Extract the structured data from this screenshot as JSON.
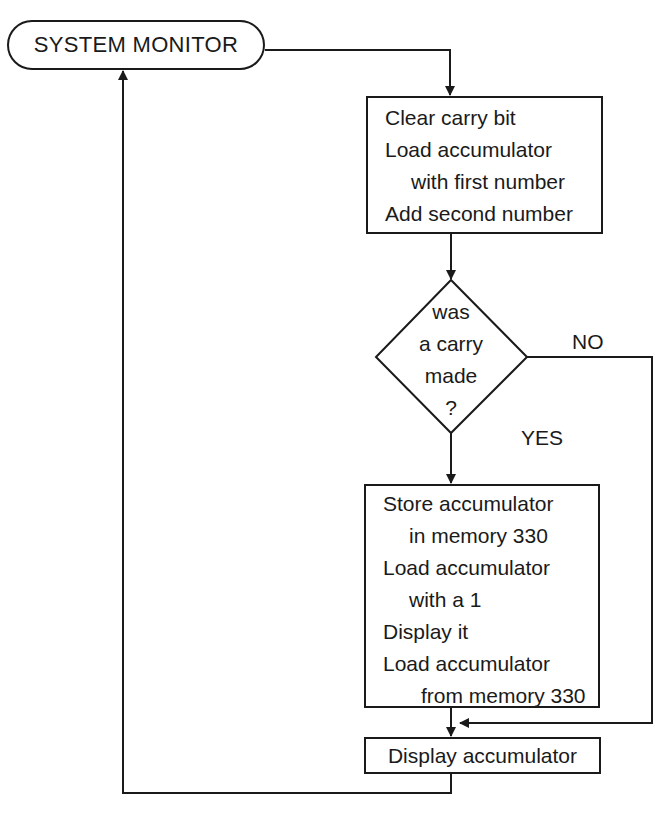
{
  "diagram": {
    "type": "flowchart",
    "nodes": {
      "start": {
        "shape": "terminator",
        "label": "SYSTEM MONITOR"
      },
      "process1": {
        "shape": "process",
        "lines": [
          "Clear carry bit",
          "Load accumulator",
          "with first number",
          "Add second number"
        ]
      },
      "decision": {
        "shape": "decision",
        "lines": [
          "was",
          "a carry",
          "made",
          "?"
        ]
      },
      "process2": {
        "shape": "process",
        "lines": [
          "Store accumulator",
          "in memory 330",
          "Load accumulator",
          "with a 1",
          "Display it",
          "Load accumulator",
          "from memory 330"
        ]
      },
      "process3": {
        "shape": "process",
        "label": "Display accumulator"
      }
    },
    "edges": {
      "no_label": "NO",
      "yes_label": "YES"
    },
    "colors": {
      "line": "#1a1a1a",
      "background": "#ffffff"
    }
  }
}
